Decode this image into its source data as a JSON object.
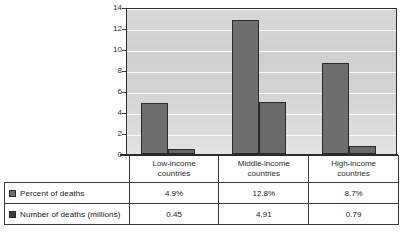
{
  "chart_data": {
    "type": "bar",
    "title": "",
    "xlabel": "",
    "ylabel": "",
    "ylim": [
      0,
      14
    ],
    "ytick_step": 2,
    "yticks": [
      "0",
      "2",
      "4",
      "6",
      "8",
      "10",
      "12",
      "14"
    ],
    "grid": true,
    "legend_position": "table-row-labels",
    "categories": [
      "Low-income countries",
      "Middle-income countries",
      "High-income countries"
    ],
    "category_lines": [
      [
        "Low-income",
        "countries"
      ],
      [
        "Middle-income",
        "countries"
      ],
      [
        "High-income",
        "countries"
      ]
    ],
    "series": [
      {
        "name": "Percent of deaths",
        "values": [
          4.9,
          12.8,
          8.7
        ],
        "display_values": [
          "4.9%",
          "12.8%",
          "8.7%"
        ],
        "color": "#6e6e6e"
      },
      {
        "name": "Number of deaths (millions)",
        "values": [
          0.45,
          4.91,
          0.79
        ],
        "display_values": [
          "0.45",
          "4.91",
          "0.79"
        ],
        "color": "#3d3d3d"
      }
    ]
  },
  "table": {
    "header_blank": "",
    "columns": [
      {
        "line1": "Low-income",
        "line2": "countries"
      },
      {
        "line1": "Middle-income",
        "line2": "countries"
      },
      {
        "line1": "High-income",
        "line2": "countries"
      }
    ],
    "rows": [
      {
        "label": "Percent of deaths",
        "swatch": "legend-swatch-percent",
        "values": [
          "4.9%",
          "12.8%",
          "8.7%"
        ]
      },
      {
        "label": "Number of deaths (millions)",
        "swatch": "legend-swatch-number",
        "values": [
          "0.45",
          "4.91",
          "0.79"
        ]
      }
    ]
  },
  "colors": {
    "bar_series_1": "#6e6e6e",
    "bar_series_2": "#3d3d3d",
    "bar_outline": "#2b2b2b",
    "plot_background": "#d4d4d4",
    "gridline": "#fbfbfb",
    "axis": "#2b2b2b",
    "table_border": "#3a3a3a"
  }
}
